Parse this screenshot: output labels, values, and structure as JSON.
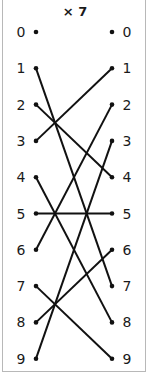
{
  "title": "× 7",
  "left_labels": [
    "0",
    "1",
    "2",
    "3",
    "4",
    "5",
    "6",
    "7",
    "8",
    "9"
  ],
  "right_labels": [
    "0",
    "1",
    "2",
    "3",
    "4",
    "5",
    "6",
    "7",
    "8",
    "9"
  ],
  "mapping": [
    {
      "from": 0,
      "to": 0
    },
    {
      "from": 1,
      "to": 7
    },
    {
      "from": 2,
      "to": 4
    },
    {
      "from": 3,
      "to": 1
    },
    {
      "from": 4,
      "to": 8
    },
    {
      "from": 5,
      "to": 5
    },
    {
      "from": 6,
      "to": 2
    },
    {
      "from": 7,
      "to": 9
    },
    {
      "from": 8,
      "to": 6
    },
    {
      "from": 9,
      "to": 3
    }
  ],
  "colors": {
    "line": "#111111",
    "text": "#1a1a1a",
    "border": "#b8b8b8"
  }
}
